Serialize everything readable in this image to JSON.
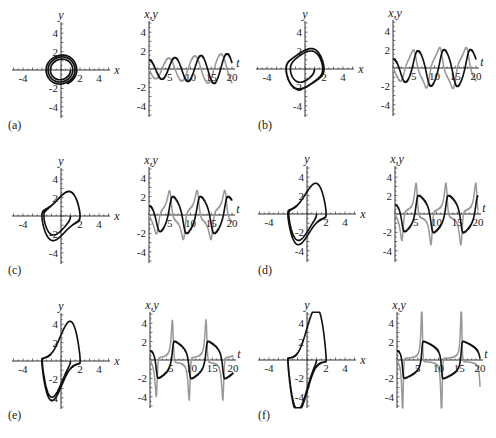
{
  "figure": {
    "panels": [
      {
        "id": "a",
        "label": "(a)"
      },
      {
        "id": "b",
        "label": "(b)"
      },
      {
        "id": "c",
        "label": "(c)"
      },
      {
        "id": "d",
        "label": "(d)"
      },
      {
        "id": "e",
        "label": "(e)"
      },
      {
        "id": "f",
        "label": "(f)"
      }
    ],
    "phase_axis": {
      "xlabel": "x",
      "ylabel": "y",
      "xticks": [
        "-4",
        "2",
        "4"
      ],
      "yticks": [
        "4",
        "2",
        "-2",
        "-4"
      ]
    },
    "time_axis": {
      "xlabel": "t",
      "ylabel": "x,y",
      "xticks": [
        "5",
        "10",
        "15",
        "20"
      ],
      "yticks": [
        "4",
        "2",
        "-2",
        "-4"
      ]
    },
    "colors": {
      "x_series": "#111111",
      "y_series": "#999999"
    }
  },
  "chart_data": [
    {
      "panel": "a",
      "type": "line",
      "title": "phase portrait",
      "xlabel": "x",
      "ylabel": "y",
      "xlim": [
        -5,
        5
      ],
      "ylim": [
        -5,
        5
      ],
      "series": [
        {
          "name": "trajectory",
          "description": "spiral converging to near-circular limit cycle radius ~2"
        }
      ]
    },
    {
      "panel": "a",
      "type": "line",
      "title": "time series",
      "xlabel": "t",
      "ylabel": "x,y",
      "xlim": [
        0,
        20
      ],
      "ylim": [
        -5,
        5
      ],
      "series": [
        {
          "name": "x",
          "color": "#111111",
          "x": [
            0,
            3,
            6.5,
            9.5,
            12.5,
            16,
            19
          ],
          "values": [
            1,
            -1.3,
            1.5,
            -1.8,
            1.9,
            -2,
            2
          ]
        },
        {
          "name": "y",
          "color": "#999999",
          "x": [
            1.5,
            5,
            8,
            11.5,
            14.5,
            18
          ],
          "values": [
            -1,
            1.4,
            -1.7,
            1.9,
            -2,
            2
          ]
        }
      ]
    },
    {
      "panel": "b",
      "type": "line",
      "title": "phase portrait",
      "xlabel": "x",
      "ylabel": "y",
      "xlim": [
        -5,
        5
      ],
      "ylim": [
        -5,
        5
      ],
      "series": [
        {
          "name": "trajectory",
          "description": "limit cycle slightly distorted, amplitude ~2"
        }
      ]
    },
    {
      "panel": "b",
      "type": "line",
      "title": "time series",
      "xlabel": "t",
      "ylabel": "x,y",
      "xlim": [
        0,
        20
      ],
      "ylim": [
        -5,
        5
      ],
      "series": [
        {
          "name": "x",
          "color": "#111111",
          "x": [
            0,
            3,
            6,
            9.5,
            12.5,
            16,
            19
          ],
          "values": [
            1,
            -1.5,
            1.9,
            -2,
            2,
            -2,
            2
          ]
        },
        {
          "name": "y",
          "color": "#999999",
          "x": [
            1.5,
            4.5,
            8,
            11,
            14.5,
            17.5
          ],
          "values": [
            -1.3,
            2,
            -2.1,
            2.2,
            -2.2,
            2.2
          ]
        }
      ]
    },
    {
      "panel": "c",
      "type": "line",
      "title": "phase portrait",
      "xlabel": "x",
      "ylabel": "y",
      "xlim": [
        -5,
        5
      ],
      "ylim": [
        -5,
        5
      ],
      "series": [
        {
          "name": "trajectory",
          "description": "limit cycle, y range about -3 to 3"
        }
      ]
    },
    {
      "panel": "c",
      "type": "line",
      "title": "time series",
      "xlabel": "t",
      "ylabel": "x,y",
      "xlim": [
        0,
        20
      ],
      "ylim": [
        -5,
        5
      ],
      "series": [
        {
          "name": "x",
          "color": "#111111",
          "x": [
            0,
            2.5,
            6,
            9,
            12.5,
            15.5,
            19
          ],
          "values": [
            1,
            -1.8,
            2,
            -2,
            2,
            -2,
            2
          ]
        },
        {
          "name": "y",
          "color": "#999999",
          "x": [
            2,
            5.5,
            8.5,
            12,
            15,
            18.5
          ],
          "values": [
            -2.2,
            2.6,
            -2.6,
            2.6,
            -2.6,
            2.6
          ]
        }
      ]
    },
    {
      "panel": "d",
      "type": "line",
      "title": "phase portrait",
      "xlabel": "x",
      "ylabel": "y",
      "xlim": [
        -5,
        5
      ],
      "ylim": [
        -5,
        5
      ],
      "series": [
        {
          "name": "trajectory",
          "description": "relaxation-like limit cycle, y range about -3.3 to 3.3"
        }
      ]
    },
    {
      "panel": "d",
      "type": "line",
      "title": "time series",
      "xlabel": "t",
      "ylabel": "x,y",
      "xlim": [
        0,
        20
      ],
      "ylim": [
        -5,
        5
      ],
      "series": [
        {
          "name": "x",
          "color": "#111111",
          "x": [
            0,
            2.5,
            6,
            9.5,
            12.5,
            16,
            19.5
          ],
          "values": [
            1,
            -2,
            2,
            -2,
            2,
            -2,
            2
          ]
        },
        {
          "name": "y",
          "color": "#999999",
          "x": [
            1.5,
            5.5,
            8.5,
            12,
            15,
            18.5
          ],
          "values": [
            -2.8,
            3.2,
            -3.2,
            3.2,
            -3.2,
            3.2
          ]
        }
      ]
    },
    {
      "panel": "e",
      "type": "line",
      "title": "phase portrait",
      "xlabel": "x",
      "ylabel": "y",
      "xlim": [
        -5,
        5
      ],
      "ylim": [
        -5,
        5
      ],
      "series": [
        {
          "name": "trajectory",
          "description": "relaxation limit cycle, y range about -4 to 4"
        }
      ]
    },
    {
      "panel": "e",
      "type": "line",
      "title": "time series",
      "xlabel": "t",
      "ylabel": "x,y",
      "xlim": [
        0,
        20
      ],
      "ylim": [
        -5,
        5
      ],
      "series": [
        {
          "name": "x",
          "color": "#111111",
          "x": [
            0,
            2.5,
            6,
            9.5,
            13,
            16.5,
            20
          ],
          "values": [
            1,
            -2,
            2,
            -2,
            2,
            -2,
            -1
          ]
        },
        {
          "name": "y",
          "color": "#999999",
          "x": [
            1.5,
            5.5,
            9,
            12.5,
            16
          ],
          "values": [
            -3.5,
            3.8,
            -3.8,
            3.8,
            -3.8
          ]
        }
      ]
    },
    {
      "panel": "f",
      "type": "line",
      "title": "phase portrait",
      "xlabel": "x",
      "ylabel": "y",
      "xlim": [
        -5,
        5
      ],
      "ylim": [
        -5,
        5
      ],
      "series": [
        {
          "name": "trajectory",
          "description": "strong relaxation limit cycle, y range about -5 to 5"
        }
      ]
    },
    {
      "panel": "f",
      "type": "line",
      "title": "time series",
      "xlabel": "t",
      "ylabel": "x,y",
      "xlim": [
        0,
        20
      ],
      "ylim": [
        -5,
        5
      ],
      "series": [
        {
          "name": "x",
          "color": "#111111",
          "x": [
            0,
            2.5,
            6.5,
            10,
            14,
            18.5
          ],
          "values": [
            1,
            -2,
            2,
            -2,
            2,
            -2
          ]
        },
        {
          "name": "y",
          "color": "#999999",
          "x": [
            1.5,
            6,
            9.5,
            13.5,
            17.5
          ],
          "values": [
            -5,
            5,
            -5,
            5,
            -5
          ]
        }
      ]
    }
  ]
}
